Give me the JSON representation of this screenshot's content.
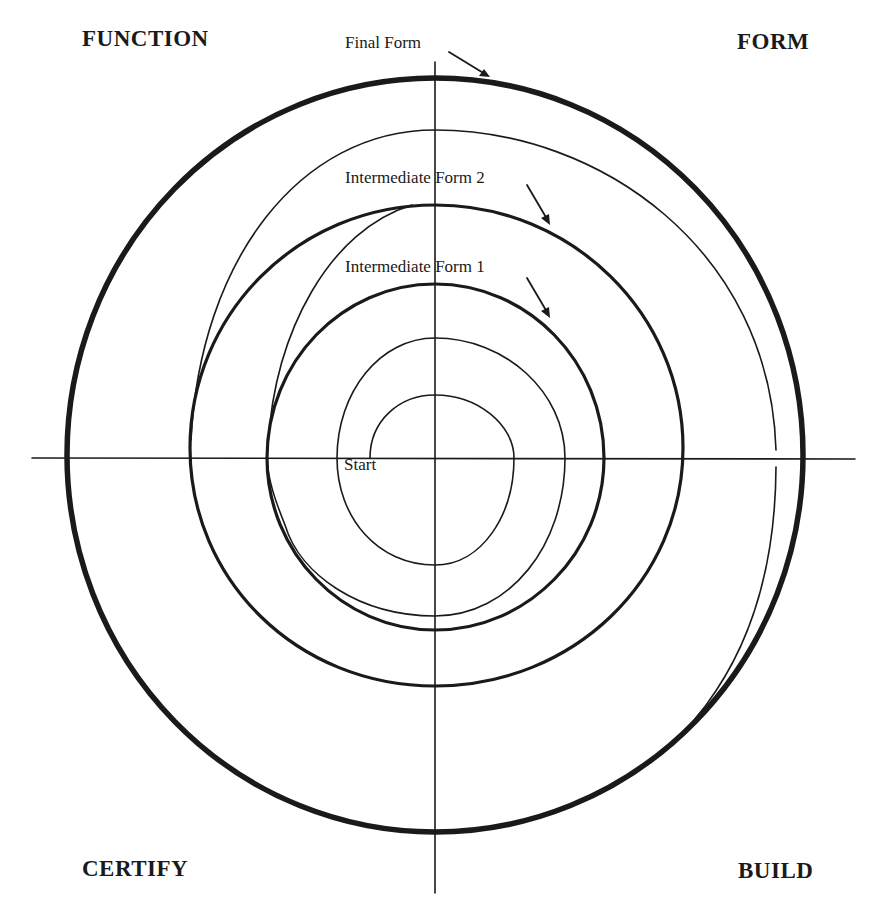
{
  "diagram": {
    "type": "spiral-development-model",
    "quadrants": {
      "top_left": "FUNCTION",
      "top_right": "FORM",
      "bottom_left": "CERTIFY",
      "bottom_right": "BUILD"
    },
    "annotations": {
      "final_form": "Final Form",
      "intermediate_form_2": "Intermediate Form 2",
      "intermediate_form_1": "Intermediate Form 1",
      "start": "Start"
    },
    "stroke_color": "#1a1a1a",
    "background": "#ffffff"
  }
}
